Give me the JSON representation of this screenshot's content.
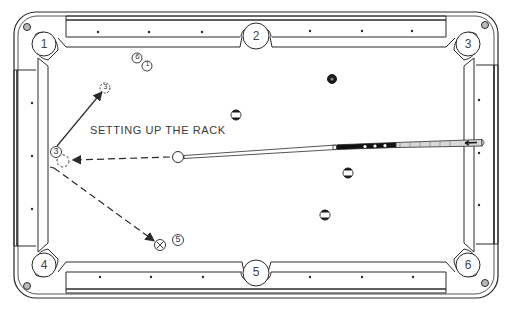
{
  "diagram": {
    "caption": "SETTING UP THE RACK",
    "pockets": [
      {
        "label": "1",
        "x": 44,
        "y": 44
      },
      {
        "label": "2",
        "x": 256,
        "y": 37
      },
      {
        "label": "3",
        "x": 468,
        "y": 44
      },
      {
        "label": "4",
        "x": 44,
        "y": 265
      },
      {
        "label": "5",
        "x": 256,
        "y": 272
      },
      {
        "label": "6",
        "x": 468,
        "y": 265
      }
    ],
    "markers": [
      {
        "label": "6",
        "x": 137,
        "y": 58
      },
      {
        "label": "1",
        "x": 147,
        "y": 65
      },
      {
        "label": "3",
        "x": 105,
        "y": 88,
        "dashed": true
      },
      {
        "label": "3",
        "x": 56,
        "y": 152
      },
      {
        "label": "5",
        "x": 178,
        "y": 240
      }
    ],
    "balls": [
      {
        "label": "8",
        "x": 332,
        "y": 79,
        "type": "solid"
      },
      {
        "label": "11",
        "x": 236,
        "y": 115,
        "type": "stripe"
      },
      {
        "label": "10",
        "x": 348,
        "y": 173,
        "type": "stripe"
      },
      {
        "label": "12",
        "x": 325,
        "y": 215,
        "type": "stripe"
      }
    ],
    "cue_ball": {
      "x": 178,
      "y": 157
    },
    "target_spot": {
      "x": 62,
      "y": 160
    },
    "x_mark": {
      "x": 160,
      "y": 245
    },
    "colors": {
      "line": "#2a2a2a",
      "background": "#ffffff",
      "text": "#3a3a3a"
    }
  }
}
